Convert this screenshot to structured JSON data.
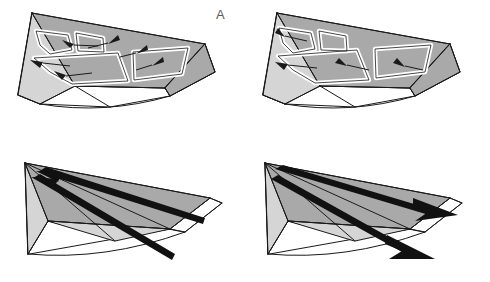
{
  "figure": {
    "type": "multi-panel-line-diagram",
    "panel_count": 4,
    "layout": "2x2 grid",
    "background_color": "#ffffff",
    "stroke_color": "#1a1a1a",
    "shaded_fill_color": "#a9a9a9",
    "light_fill_color": "#d5d5d5",
    "white_fill_color": "#ffffff",
    "label_color": "#5a5a5a"
  },
  "panels": [
    {
      "id": "A",
      "label": "A",
      "position": "top-left",
      "description": "Wedge-shaped three-dimensional block diagram with grey shaded facets and white outlined ribbon loops; small solid arrowheads on the shaded surfaces indicate slip direction.",
      "contents": {
        "ribbon_loops": 4,
        "arrowheads": 6,
        "arrow_direction": "toward upper-left apex"
      }
    },
    {
      "id": "C",
      "label": "C",
      "position": "top-right",
      "description": "Wedge-shaped three-dimensional block diagram with grey shaded facets and white outlined ribbon loops; small solid arrowheads point toward the lower-right.",
      "contents": {
        "ribbon_loops": 4,
        "arrowheads": 4,
        "arrow_direction": "toward lower-right"
      }
    },
    {
      "id": "B",
      "label": "B",
      "position": "bottom-left",
      "description": "Same wedge block diagram without ribbon loops; two thick black arrows run from lower-right to the upper-left apex, arrowheads at the apex end.",
      "contents": {
        "ribbon_loops": 0,
        "thick_arrows": 2,
        "arrow_direction": "toward upper-left apex"
      }
    },
    {
      "id": "D",
      "label": "D",
      "position": "bottom-right",
      "description": "Same wedge block diagram without ribbon loops; two thick black arrows run from the upper-left apex toward the lower-right, arrowheads at the lower-right ends.",
      "contents": {
        "ribbon_loops": 0,
        "thick_arrows": 2,
        "arrow_direction": "toward lower-right"
      }
    }
  ]
}
